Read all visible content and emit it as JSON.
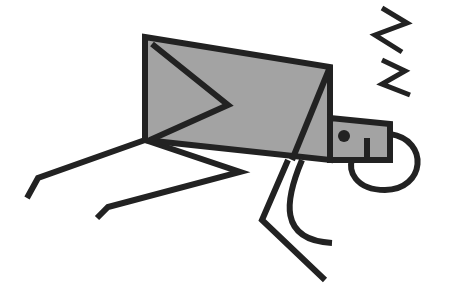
{
  "illustration": {
    "subject": "sleeping box-bodied stick figure",
    "colors": {
      "background": "#ffffff",
      "stroke": "#222222",
      "fill": "#a3a3a3"
    },
    "stroke_width": 6,
    "body": {
      "points": "145,37 330,67 330,160 145,140"
    },
    "body_chevron": {
      "points": "152,44 228,105 150,140"
    },
    "body_diagonal": {
      "points": "330,67 292,160"
    },
    "head": {
      "points": "330,118 390,124 390,160 330,160"
    },
    "eye": {
      "cx": 344,
      "cy": 136,
      "r": 6
    },
    "mouth": {
      "x1": 367,
      "y1": 138,
      "x2": 367,
      "y2": 160
    },
    "head_loop": {
      "d": "M390,134 C430,140 425,190 385,190 C355,190 348,170 352,160"
    },
    "arms": [
      {
        "points": "145,140 38,178 27,198"
      },
      {
        "points": "145,140 240,172 108,207 97,218"
      }
    ],
    "legs": [
      {
        "points": "288,160 262,220 325,280"
      },
      {
        "d": "M302,160 C285,200 278,240 332,243"
      }
    ],
    "zzz": [
      {
        "points": "382,8 407,23 375,35 402,52"
      },
      {
        "points": "382,60 405,71 382,84 410,95"
      }
    ]
  }
}
